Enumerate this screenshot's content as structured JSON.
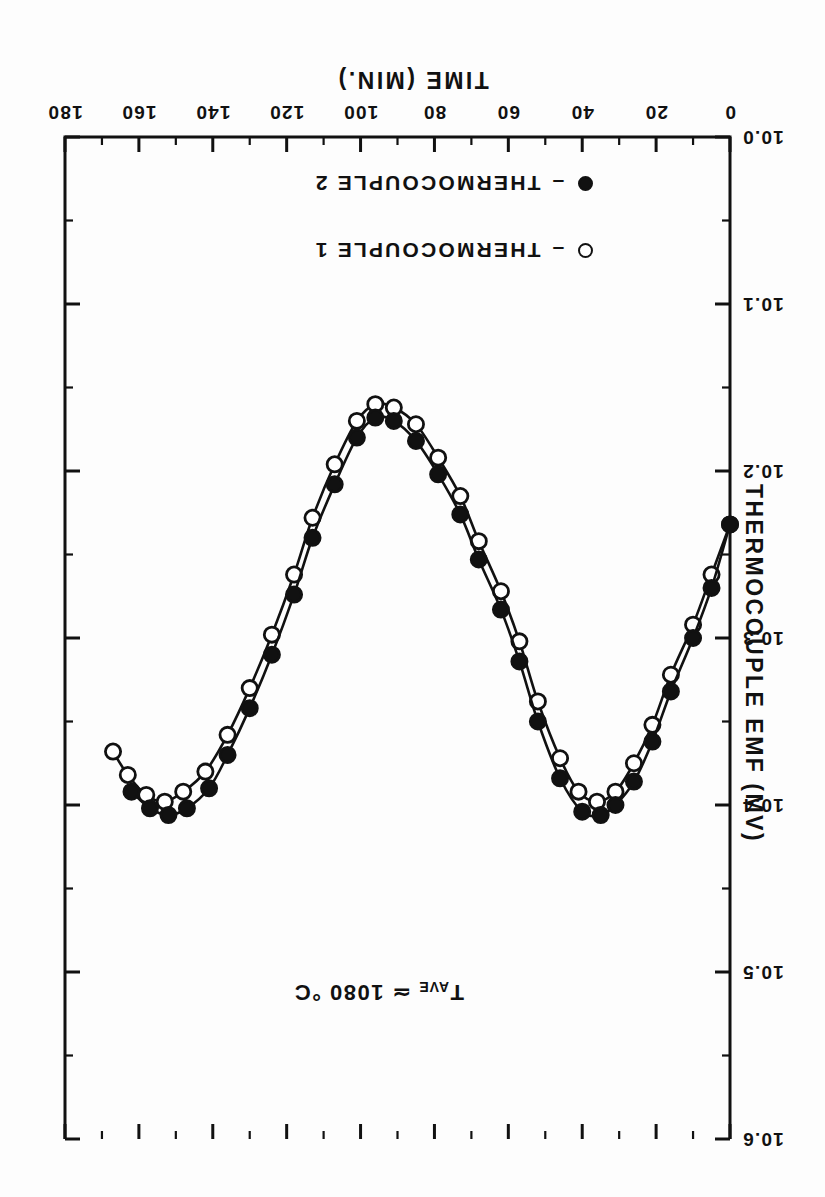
{
  "figure": {
    "orientation": "rotated-180",
    "background_color": "#fdfdfd",
    "ink_color": "#111111"
  },
  "annotation": {
    "prefix": "T",
    "subscript": "AVE",
    "text": " ≃ 1080 °C",
    "full": "T AVE ≃ 1080 °C"
  },
  "legend": {
    "items": [
      {
        "marker": "open-circle",
        "dash": "–",
        "label": "THERMOCOUPLE 1"
      },
      {
        "marker": "filled-circle",
        "dash": "–",
        "label": "THERMOCOUPLE 2"
      }
    ]
  },
  "chart_data": {
    "type": "line",
    "title": "",
    "subtitle": "",
    "xlabel": "TIME (MIN.)",
    "ylabel": "THERMOCOUPLE EMF (MV)",
    "xlim": [
      0,
      180
    ],
    "ylim": [
      10.0,
      10.6
    ],
    "xticks": [
      0,
      20,
      40,
      60,
      80,
      100,
      120,
      140,
      160,
      180
    ],
    "xtick_labels": [
      "0",
      "20",
      "40",
      "60",
      "80",
      "100",
      "120",
      "140",
      "160",
      "180"
    ],
    "xminor_step": 10,
    "yticks": [
      10.0,
      10.1,
      10.2,
      10.3,
      10.4,
      10.5,
      10.6
    ],
    "ytick_labels": [
      "10.0",
      "10.1",
      "10.2",
      "10.3",
      "10.4",
      "10.5",
      "10.6"
    ],
    "yminor_step": 0.05,
    "grid": false,
    "legend_position": "lower-left-inside",
    "annotations": [
      {
        "text": "T AVE ≃ 1080 °C",
        "x": 72,
        "y": 10.52
      }
    ],
    "series": [
      {
        "name": "THERMOCOUPLE 1",
        "marker": "open-circle",
        "x": [
          0,
          5,
          10,
          16,
          21,
          26,
          31,
          36,
          41,
          46,
          52,
          57,
          62,
          68,
          73,
          79,
          85,
          91,
          96,
          101,
          107,
          113,
          118,
          124,
          130,
          136,
          142,
          148,
          153,
          158,
          163,
          167
        ],
        "y": [
          10.232,
          10.262,
          10.292,
          10.322,
          10.352,
          10.375,
          10.392,
          10.398,
          10.392,
          10.372,
          10.338,
          10.302,
          10.272,
          10.242,
          10.215,
          10.192,
          10.172,
          10.162,
          10.16,
          10.17,
          10.196,
          10.228,
          10.262,
          10.298,
          10.33,
          10.358,
          10.38,
          10.392,
          10.398,
          10.394,
          10.382,
          10.368
        ]
      },
      {
        "name": "THERMOCOUPLE 2",
        "marker": "filled-circle",
        "x": [
          0,
          5,
          10,
          16,
          21,
          26,
          31,
          35,
          40,
          46,
          52,
          57,
          62,
          68,
          73,
          79,
          85,
          91,
          96,
          101,
          107,
          113,
          118,
          124,
          130,
          136,
          141,
          147,
          152,
          157,
          162
        ],
        "y": [
          10.232,
          10.27,
          10.3,
          10.332,
          10.362,
          10.386,
          10.4,
          10.406,
          10.404,
          10.384,
          10.35,
          10.314,
          10.283,
          10.253,
          10.226,
          10.202,
          10.182,
          10.17,
          10.168,
          10.18,
          10.208,
          10.24,
          10.274,
          10.31,
          10.342,
          10.37,
          10.39,
          10.402,
          10.406,
          10.402,
          10.392
        ]
      }
    ]
  }
}
